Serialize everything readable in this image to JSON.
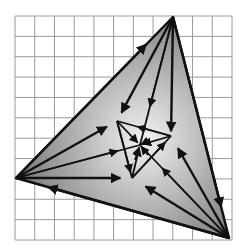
{
  "grid": {
    "x0": 15,
    "y0": 16,
    "x1": 232,
    "y1": 240,
    "cols": 11,
    "rows": 11,
    "color": "#9a9a9a"
  },
  "outer_triangle": {
    "top": [
      173,
      17
    ],
    "left": [
      16,
      178
    ],
    "bottom_right": [
      229,
      238
    ],
    "fill_center": "#f2f2f2",
    "fill_edge": "#7a7a7a"
  },
  "inner_triangle": {
    "a": [
      117,
      121
    ],
    "b": [
      171,
      136
    ],
    "c": [
      132,
      178
    ]
  },
  "center": [
    140,
    145
  ],
  "line_color": "#111111"
}
